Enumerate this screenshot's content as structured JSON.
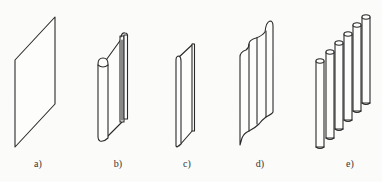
{
  "figure": {
    "panels": [
      {
        "id": "a",
        "label": "a)",
        "shape": "flat-plate"
      },
      {
        "id": "b",
        "label": "b)",
        "shape": "plate-with-rolled-edges-and-flanges"
      },
      {
        "id": "c",
        "label": "c)",
        "shape": "narrow-plate-with-rolled-edge"
      },
      {
        "id": "d",
        "label": "d)",
        "shape": "corrugated-plate"
      },
      {
        "id": "e",
        "label": "e)",
        "shape": "row-of-six-cylindrical-rods"
      }
    ],
    "colors": {
      "stroke": "#2a2a2a",
      "background": "#fbfbfa"
    }
  }
}
